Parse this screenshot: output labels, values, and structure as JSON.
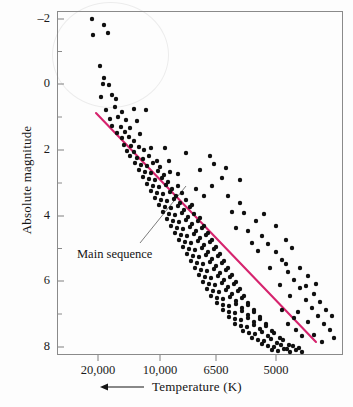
{
  "chart_data": {
    "type": "scatter",
    "title": "",
    "xlabel": "Temperature (K)",
    "ylabel": "Absolute magnitude",
    "x_axis": {
      "tick_labels": [
        "20,000",
        "10,000",
        "6500",
        "5000"
      ],
      "tick_positions_px": [
        98,
        160,
        216,
        276
      ],
      "direction_arrow": "left",
      "note": "temperature decreases to the right"
    },
    "y_axis": {
      "tick_labels": [
        "-2",
        "0",
        "2",
        "4",
        "6",
        "8"
      ],
      "tick_values": [
        -2,
        0,
        2,
        4,
        6,
        8
      ],
      "ylim": [
        -2.7,
        8.7
      ],
      "inverted": true,
      "minor_ticks": true
    },
    "grid": false,
    "legend": "none",
    "annotations": [
      {
        "text": "Main sequence",
        "label_x": 77,
        "label_y": 247,
        "leader_from_x": 140,
        "leader_from_y": 243,
        "leader_to_x": 186,
        "leader_to_y": 186
      }
    ],
    "series": [
      {
        "name": "Main sequence fit line",
        "type": "line",
        "color": "#d6246e",
        "x_px": [
          96,
          316
        ],
        "y_px": [
          113,
          342
        ]
      },
      {
        "name": "Stars",
        "type": "scatter",
        "color": "#101010",
        "marker_size_px": 4.4,
        "points_px": [
          [
            92,
            19
          ],
          [
            104,
            25
          ],
          [
            93,
            35
          ],
          [
            108,
            33
          ],
          [
            100,
            66
          ],
          [
            104,
            78
          ],
          [
            103,
            84
          ],
          [
            109,
            85
          ],
          [
            101,
            97
          ],
          [
            112,
            95
          ],
          [
            116,
            99
          ],
          [
            106,
            110
          ],
          [
            115,
            107
          ],
          [
            122,
            112
          ],
          [
            134,
            109
          ],
          [
            146,
            110
          ],
          [
            110,
            119
          ],
          [
            118,
            117
          ],
          [
            126,
            120
          ],
          [
            137,
            121
          ],
          [
            112,
            126
          ],
          [
            121,
            127
          ],
          [
            130,
            128
          ],
          [
            117,
            133
          ],
          [
            125,
            132
          ],
          [
            122,
            138
          ],
          [
            129,
            137
          ],
          [
            134,
            141
          ],
          [
            140,
            134
          ],
          [
            124,
            145
          ],
          [
            131,
            146
          ],
          [
            139,
            147
          ],
          [
            127,
            151
          ],
          [
            134,
            152
          ],
          [
            144,
            150
          ],
          [
            151,
            148
          ],
          [
            130,
            156
          ],
          [
            137,
            158
          ],
          [
            143,
            159
          ],
          [
            149,
            156
          ],
          [
            157,
            161
          ],
          [
            135,
            163
          ],
          [
            141,
            165
          ],
          [
            147,
            166
          ],
          [
            153,
            163
          ],
          [
            160,
            167
          ],
          [
            139,
            170
          ],
          [
            145,
            172
          ],
          [
            151,
            173
          ],
          [
            158,
            171
          ],
          [
            164,
            175
          ],
          [
            170,
            172
          ],
          [
            143,
            177
          ],
          [
            149,
            179
          ],
          [
            155,
            180
          ],
          [
            162,
            178
          ],
          [
            168,
            182
          ],
          [
            147,
            184
          ],
          [
            153,
            186
          ],
          [
            159,
            187
          ],
          [
            166,
            185
          ],
          [
            172,
            189
          ],
          [
            178,
            186
          ],
          [
            151,
            191
          ],
          [
            157,
            193
          ],
          [
            163,
            194
          ],
          [
            170,
            192
          ],
          [
            176,
            196
          ],
          [
            182,
            193
          ],
          [
            155,
            198
          ],
          [
            161,
            200
          ],
          [
            167,
            201
          ],
          [
            174,
            199
          ],
          [
            180,
            203
          ],
          [
            186,
            200
          ],
          [
            192,
            205
          ],
          [
            159,
            205
          ],
          [
            165,
            207
          ],
          [
            171,
            208
          ],
          [
            178,
            206
          ],
          [
            184,
            210
          ],
          [
            190,
            207
          ],
          [
            163,
            212
          ],
          [
            169,
            214
          ],
          [
            175,
            215
          ],
          [
            182,
            213
          ],
          [
            188,
            217
          ],
          [
            194,
            214
          ],
          [
            200,
            218
          ],
          [
            167,
            219
          ],
          [
            173,
            221
          ],
          [
            179,
            222
          ],
          [
            186,
            220
          ],
          [
            192,
            224
          ],
          [
            198,
            221
          ],
          [
            204,
            226
          ],
          [
            171,
            226
          ],
          [
            177,
            228
          ],
          [
            183,
            229
          ],
          [
            190,
            227
          ],
          [
            196,
            231
          ],
          [
            202,
            228
          ],
          [
            208,
            233
          ],
          [
            175,
            233
          ],
          [
            181,
            235
          ],
          [
            187,
            236
          ],
          [
            194,
            234
          ],
          [
            200,
            238
          ],
          [
            206,
            235
          ],
          [
            212,
            240
          ],
          [
            179,
            240
          ],
          [
            185,
            242
          ],
          [
            191,
            243
          ],
          [
            198,
            241
          ],
          [
            204,
            245
          ],
          [
            210,
            242
          ],
          [
            216,
            247
          ],
          [
            183,
            247
          ],
          [
            189,
            249
          ],
          [
            195,
            250
          ],
          [
            202,
            248
          ],
          [
            208,
            252
          ],
          [
            214,
            249
          ],
          [
            220,
            254
          ],
          [
            187,
            254
          ],
          [
            193,
            256
          ],
          [
            199,
            257
          ],
          [
            206,
            255
          ],
          [
            212,
            259
          ],
          [
            218,
            256
          ],
          [
            224,
            261
          ],
          [
            191,
            261
          ],
          [
            197,
            263
          ],
          [
            203,
            264
          ],
          [
            210,
            262
          ],
          [
            216,
            266
          ],
          [
            222,
            263
          ],
          [
            228,
            268
          ],
          [
            195,
            268
          ],
          [
            201,
            270
          ],
          [
            207,
            271
          ],
          [
            214,
            269
          ],
          [
            220,
            273
          ],
          [
            226,
            270
          ],
          [
            232,
            275
          ],
          [
            199,
            275
          ],
          [
            205,
            277
          ],
          [
            211,
            278
          ],
          [
            218,
            276
          ],
          [
            224,
            280
          ],
          [
            230,
            277
          ],
          [
            236,
            282
          ],
          [
            203,
            282
          ],
          [
            209,
            284
          ],
          [
            215,
            285
          ],
          [
            222,
            283
          ],
          [
            228,
            287
          ],
          [
            234,
            284
          ],
          [
            240,
            289
          ],
          [
            207,
            289
          ],
          [
            213,
            291
          ],
          [
            219,
            292
          ],
          [
            226,
            290
          ],
          [
            232,
            294
          ],
          [
            238,
            291
          ],
          [
            244,
            296
          ],
          [
            211,
            296
          ],
          [
            217,
            298
          ],
          [
            223,
            299
          ],
          [
            230,
            297
          ],
          [
            236,
            301
          ],
          [
            242,
            298
          ],
          [
            248,
            303
          ],
          [
            217,
            303
          ],
          [
            223,
            305
          ],
          [
            229,
            306
          ],
          [
            236,
            304
          ],
          [
            242,
            308
          ],
          [
            248,
            305
          ],
          [
            254,
            310
          ],
          [
            223,
            310
          ],
          [
            229,
            312
          ],
          [
            235,
            313
          ],
          [
            242,
            311
          ],
          [
            248,
            315
          ],
          [
            254,
            312
          ],
          [
            260,
            317
          ],
          [
            229,
            317
          ],
          [
            235,
            319
          ],
          [
            241,
            320
          ],
          [
            248,
            318
          ],
          [
            254,
            322
          ],
          [
            260,
            319
          ],
          [
            266,
            324
          ],
          [
            235,
            324
          ],
          [
            241,
            326
          ],
          [
            247,
            327
          ],
          [
            254,
            325
          ],
          [
            260,
            329
          ],
          [
            266,
            326
          ],
          [
            272,
            331
          ],
          [
            243,
            331
          ],
          [
            249,
            333
          ],
          [
            255,
            334
          ],
          [
            262,
            332
          ],
          [
            268,
            336
          ],
          [
            274,
            333
          ],
          [
            280,
            338
          ],
          [
            252,
            338
          ],
          [
            258,
            340
          ],
          [
            264,
            341
          ],
          [
            271,
            339
          ],
          [
            277,
            343
          ],
          [
            283,
            340
          ],
          [
            289,
            345
          ],
          [
            262,
            344
          ],
          [
            268,
            346
          ],
          [
            274,
            347
          ],
          [
            281,
            345
          ],
          [
            287,
            349
          ],
          [
            293,
            346
          ],
          [
            299,
            348
          ],
          [
            272,
            350
          ],
          [
            278,
            351
          ],
          [
            284,
            349
          ],
          [
            290,
            352
          ],
          [
            296,
            350
          ],
          [
            302,
            352
          ],
          [
            169,
            161
          ],
          [
            186,
            153
          ],
          [
            200,
            170
          ],
          [
            214,
            164
          ],
          [
            165,
            148
          ],
          [
            222,
            178
          ],
          [
            196,
            189
          ],
          [
            228,
            196
          ],
          [
            240,
            203
          ],
          [
            212,
            186
          ],
          [
            244,
            213
          ],
          [
            256,
            221
          ],
          [
            248,
            231
          ],
          [
            236,
            228
          ],
          [
            262,
            236
          ],
          [
            268,
            244
          ],
          [
            276,
            252
          ],
          [
            258,
            251
          ],
          [
            282,
            260
          ],
          [
            270,
            268
          ],
          [
            288,
            272
          ],
          [
            294,
            280
          ],
          [
            280,
            285
          ],
          [
            300,
            288
          ],
          [
            290,
            296
          ],
          [
            306,
            300
          ],
          [
            312,
            308
          ],
          [
            298,
            312
          ],
          [
            318,
            316
          ],
          [
            308,
            322
          ],
          [
            324,
            324
          ],
          [
            330,
            330
          ],
          [
            314,
            335
          ],
          [
            322,
            342
          ],
          [
            334,
            338
          ],
          [
            286,
            264
          ],
          [
            252,
            243
          ],
          [
            232,
            212
          ],
          [
            204,
            196
          ],
          [
            178,
            174
          ],
          [
            300,
            268
          ],
          [
            308,
            276
          ],
          [
            316,
            284
          ],
          [
            286,
            240
          ],
          [
            292,
            248
          ],
          [
            276,
            226
          ],
          [
            264,
            214
          ],
          [
            240,
            180
          ],
          [
            226,
            168
          ],
          [
            210,
            156
          ],
          [
            326,
            310
          ],
          [
            332,
            316
          ],
          [
            320,
            302
          ],
          [
            314,
            294
          ],
          [
            306,
            286
          ],
          [
            296,
            330
          ],
          [
            302,
            336
          ],
          [
            288,
            324
          ],
          [
            294,
            318
          ],
          [
            282,
            310
          ]
        ]
      }
    ]
  },
  "axis_render": {
    "frame": {
      "left": 57,
      "top": 11,
      "width": 286,
      "height": 344
    },
    "y_ticks_px": [
      19,
      84,
      150,
      216,
      281,
      347
    ],
    "y_minor_px": [
      51.5,
      117,
      183,
      248.5,
      314
    ],
    "x_ticks_px": [
      98,
      160,
      216,
      276
    ]
  }
}
